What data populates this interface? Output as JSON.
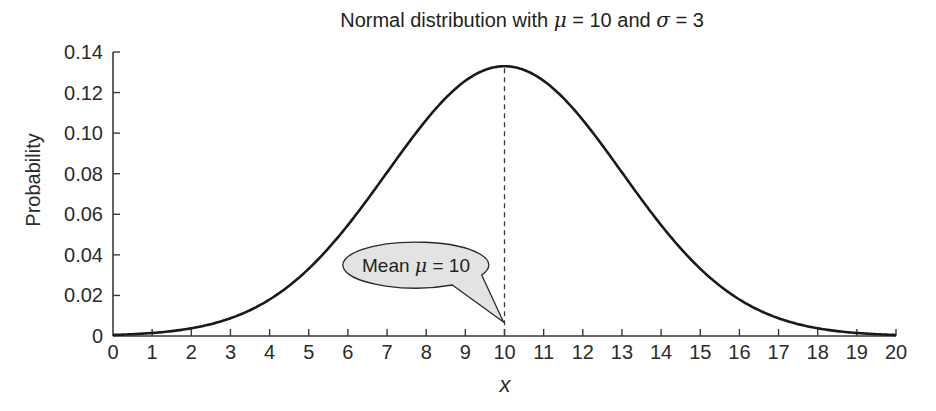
{
  "chart_data": {
    "type": "line",
    "title": "Normal distribution with μ = 10 and σ = 3",
    "title_parts": {
      "prefix": "Normal distribution with ",
      "mu_symbol": "μ",
      "mid": " = 10 and ",
      "sigma_symbol": "σ",
      "suffix": " = 3"
    },
    "xlabel": "x",
    "ylabel": "Probability",
    "xlim": [
      0,
      20
    ],
    "ylim": [
      0,
      0.14
    ],
    "grid": false,
    "legend": null,
    "x_ticks": [
      "0",
      "1",
      "2",
      "3",
      "4",
      "5",
      "6",
      "7",
      "8",
      "9",
      "10",
      "11",
      "12",
      "13",
      "14",
      "15",
      "16",
      "17",
      "18",
      "19",
      "20"
    ],
    "y_ticks": [
      "0",
      "0.02",
      "0.04",
      "0.06",
      "0.08",
      "0.10",
      "0.12",
      "0.14"
    ],
    "series": [
      {
        "name": "Normal pdf (μ=10, σ=3)",
        "x": [
          0,
          1,
          2,
          3,
          4,
          5,
          6,
          7,
          8,
          9,
          10,
          11,
          12,
          13,
          14,
          15,
          16,
          17,
          18,
          19,
          20
        ],
        "values": [
          0.0005,
          0.0015,
          0.0038,
          0.0087,
          0.018,
          0.0332,
          0.0547,
          0.0807,
          0.1065,
          0.1258,
          0.133,
          0.1258,
          0.1065,
          0.0807,
          0.0547,
          0.0332,
          0.018,
          0.0087,
          0.0038,
          0.0015,
          0.0005
        ]
      }
    ],
    "parameters": {
      "mu": 10,
      "sigma": 3
    },
    "annotations": [
      {
        "type": "vline",
        "x": 10,
        "style": "dashed"
      },
      {
        "type": "callout",
        "text_prefix": "Mean ",
        "mu_symbol": "μ",
        "text_suffix": " = 10",
        "points_to": [
          10,
          0
        ]
      }
    ]
  },
  "colors": {
    "curve": "#1a1a1a",
    "axis": "#3a3a3a",
    "callout_fill": "#e3e3e3",
    "callout_stroke": "#2a2a2a",
    "text": "#231f20"
  }
}
